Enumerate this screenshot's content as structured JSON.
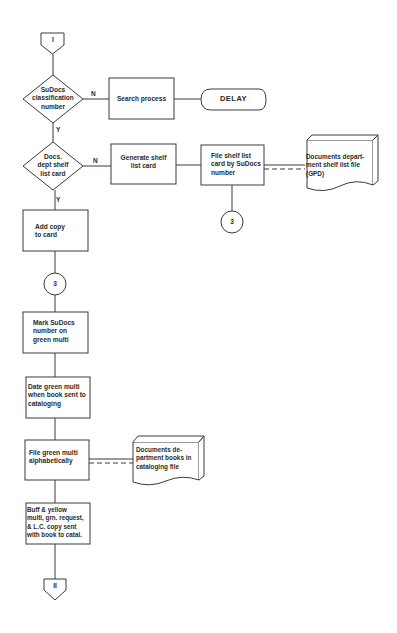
{
  "diagram": {
    "type": "flowchart",
    "connectors": {
      "start": "I",
      "end": "II"
    },
    "decisions": [
      {
        "id": "d1",
        "label": "SuDocs classification number",
        "lines": [
          "SuDocs",
          "classification",
          "number"
        ],
        "yes": "Y",
        "no": "N"
      },
      {
        "id": "d2",
        "label": "Docs. dept shelf list card",
        "lines": [
          "Docs.",
          "dept shelf",
          "list card"
        ],
        "yes": "Y",
        "no": "N"
      }
    ],
    "processes": {
      "search": "Search process",
      "generate": [
        "Generate shelf",
        "list card"
      ],
      "file_shelf": [
        "File shelf list",
        "card by SuDocs",
        "number"
      ],
      "add_copy": [
        "Add copy",
        "to card"
      ],
      "mark": [
        "Mark SuDocs",
        "number on",
        "green multi"
      ],
      "date": [
        "Date green multi",
        "when book sent to",
        "cataloging"
      ],
      "file_green": [
        "File green multi",
        "alphabetically"
      ],
      "buff": [
        "Buff & yellow",
        "multi, grn. request,",
        "& L.C. copy sent",
        "with book to catal."
      ]
    },
    "terminator": "DELAY",
    "documents": {
      "shelf_list_file": [
        "Documents depart-",
        "ment shelf list file",
        "(GPD)"
      ],
      "cataloging_file": [
        "Documents de-",
        "partment books in",
        "cataloging file"
      ]
    },
    "page_connectors": {
      "right": "3",
      "left": "3"
    },
    "colors": {
      "line": "#3a3a3a",
      "text": "#2a2a2a",
      "background": "#ffffff"
    }
  }
}
